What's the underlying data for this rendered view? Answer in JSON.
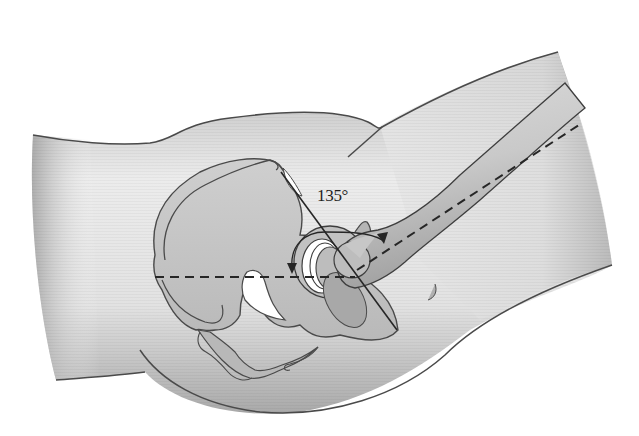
{
  "figure": {
    "angle_label": "135°",
    "annotations": {
      "horizontal_reference": "dashed horizontal line through acetabulum",
      "femur_axis": "dashed line along femoral shaft",
      "acetabular_line": "solid diagonal line through acetabulum",
      "angle_arc": "circular arc with arrowheads indicating 135° angle"
    }
  },
  "colors": {
    "background": "#ffffff",
    "body_fill_light": "#ececec",
    "body_fill_dark": "#b8b8b8",
    "bone_fill": "#c4c4c4",
    "outline": "#4a4a4a",
    "line": "#2a2a2a",
    "cartilage": "#ffffff"
  }
}
